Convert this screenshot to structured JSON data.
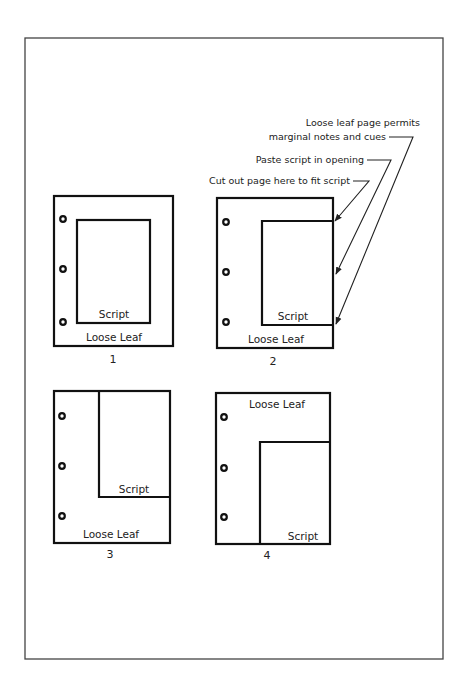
{
  "figure": {
    "callouts": [
      {
        "id": "marginal",
        "lines": [
          "Loose leaf page permits",
          "marginal notes and cues"
        ]
      },
      {
        "id": "paste",
        "lines": [
          "Paste script in opening"
        ]
      },
      {
        "id": "cutout",
        "lines": [
          "Cut out page here to fit script"
        ]
      }
    ],
    "diagrams": [
      {
        "number": "1",
        "page_label": "Loose Leaf",
        "script_label": "Script"
      },
      {
        "number": "2",
        "page_label": "Loose Leaf",
        "script_label": "Script"
      },
      {
        "number": "3",
        "page_label": "Loose Leaf",
        "script_label": "Script"
      },
      {
        "number": "4",
        "page_label": "Loose Leaf",
        "script_label": "Script"
      }
    ]
  }
}
